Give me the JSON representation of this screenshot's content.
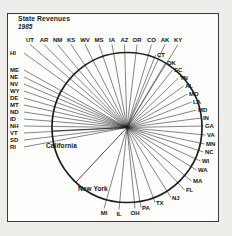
{
  "header": {
    "title": "State Revenues",
    "year": "1985"
  },
  "chart_data": {
    "type": "pie",
    "title": "State Revenues",
    "subtitle": "1985",
    "unit": "relative share of total state revenues",
    "values_are_estimates": true,
    "numeric_labels_shown": false,
    "order": "clockwise starting just left of the 9 o'clock position",
    "interior_labels": [
      "California",
      "New York"
    ],
    "slices": [
      {
        "label": "RI",
        "value": 0.35
      },
      {
        "label": "SD",
        "value": 0.41
      },
      {
        "label": "VT",
        "value": 0.46
      },
      {
        "label": "NH",
        "value": 0.52
      },
      {
        "label": "ID",
        "value": 0.57
      },
      {
        "label": "ND",
        "value": 0.63
      },
      {
        "label": "MT",
        "value": 0.68
      },
      {
        "label": "DE",
        "value": 0.74
      },
      {
        "label": "WY",
        "value": 0.8
      },
      {
        "label": "NV",
        "value": 0.85
      },
      {
        "label": "NE",
        "value": 0.91
      },
      {
        "label": "ME",
        "value": 0.96
      },
      {
        "label": "HI",
        "value": 1.02
      },
      {
        "label": "UT",
        "value": 1.07
      },
      {
        "label": "AR",
        "value": 1.13
      },
      {
        "label": "NM",
        "value": 1.18
      },
      {
        "label": "KS",
        "value": 1.24
      },
      {
        "label": "WV",
        "value": 1.3
      },
      {
        "label": "MS",
        "value": 1.35
      },
      {
        "label": "IA",
        "value": 1.41
      },
      {
        "label": "AZ",
        "value": 1.46
      },
      {
        "label": "OR",
        "value": 1.52
      },
      {
        "label": "CO",
        "value": 1.57
      },
      {
        "label": "AK",
        "value": 1.63
      },
      {
        "label": "KY",
        "value": 1.69
      },
      {
        "label": "CT",
        "value": 1.74
      },
      {
        "label": "OK",
        "value": 1.8
      },
      {
        "label": "SC",
        "value": 1.85
      },
      {
        "label": "TN",
        "value": 1.91
      },
      {
        "label": "AL",
        "value": 1.96
      },
      {
        "label": "MO",
        "value": 2.02
      },
      {
        "label": "LA",
        "value": 2.07
      },
      {
        "label": "MD",
        "value": 2.13
      },
      {
        "label": "IN",
        "value": 2.19
      },
      {
        "label": "GA",
        "value": 2.24
      },
      {
        "label": "VA",
        "value": 2.3
      },
      {
        "label": "MN",
        "value": 2.35
      },
      {
        "label": "NC",
        "value": 2.41
      },
      {
        "label": "WI",
        "value": 2.46
      },
      {
        "label": "WA",
        "value": 2.52
      },
      {
        "label": "MA",
        "value": 2.58
      },
      {
        "label": "FL",
        "value": 2.63
      },
      {
        "label": "NJ",
        "value": 2.69
      },
      {
        "label": "TX",
        "value": 2.74
      },
      {
        "label": "PA",
        "value": 2.8
      },
      {
        "label": "OH",
        "value": 2.85
      },
      {
        "label": "IL",
        "value": 2.91
      },
      {
        "label": "MI",
        "value": 2.97
      },
      {
        "label": "New York",
        "value": 8.1
      },
      {
        "label": "California",
        "value": 12.2
      }
    ],
    "colors": {
      "ink": "#1f1f1f",
      "paper": "#fdfdfb",
      "margin": "#efede9"
    }
  }
}
